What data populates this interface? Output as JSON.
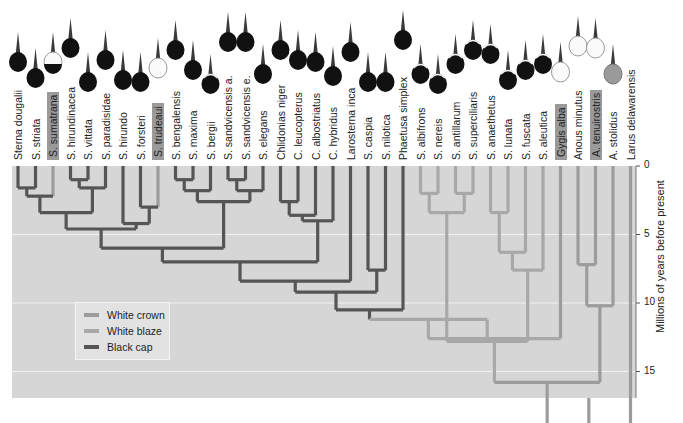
{
  "diagram": {
    "type": "phylogenetic-tree",
    "axis": {
      "title": "Millions of years before present",
      "ticks": [
        "0",
        "5",
        "10",
        "15",
        "20"
      ]
    },
    "legend": [
      {
        "label": "White crown",
        "color": "#9c9c9c"
      },
      {
        "label": "White blaze",
        "color": "#a8a8a8"
      },
      {
        "label": "Black cap",
        "color": "#555555"
      }
    ],
    "colors": {
      "panel_bg": "#d6d6d6",
      "gridline": "#f2f2f2",
      "black_cap": "#555555",
      "white_crown": "#9c9c9c",
      "white_blaze": "#a8a8a8"
    },
    "species": [
      {
        "label": "Sterna dougalii",
        "trait": "black_cap",
        "head": "black",
        "highlight": false
      },
      {
        "label": "S. striata",
        "trait": "black_cap",
        "head": "black",
        "highlight": false
      },
      {
        "label": "S. sumatrana",
        "trait": "white_crown",
        "head": "white_nape",
        "highlight": true
      },
      {
        "label": "S. hirundinacea",
        "trait": "black_cap",
        "head": "black",
        "highlight": false
      },
      {
        "label": "S. vittata",
        "trait": "black_cap",
        "head": "black",
        "highlight": false
      },
      {
        "label": "S. paradisidae",
        "trait": "black_cap",
        "head": "black",
        "highlight": false
      },
      {
        "label": "S. hirundo",
        "trait": "black_cap",
        "head": "black",
        "highlight": false
      },
      {
        "label": "S. forsteri",
        "trait": "black_cap",
        "head": "black",
        "highlight": false
      },
      {
        "label": "S. trudeaui",
        "trait": "white_crown",
        "head": "white",
        "highlight": true
      },
      {
        "label": "S. bengalensis",
        "trait": "black_cap",
        "head": "black",
        "highlight": false
      },
      {
        "label": "S. maxima",
        "trait": "black_cap",
        "head": "black",
        "highlight": false
      },
      {
        "label": "S. bergii",
        "trait": "black_cap",
        "head": "black_blaze",
        "highlight": false
      },
      {
        "label": "S. sandvicensis a.",
        "trait": "black_cap",
        "head": "black",
        "highlight": false
      },
      {
        "label": "S. sandvicensis e.",
        "trait": "black_cap",
        "head": "black",
        "highlight": false
      },
      {
        "label": "S. elegans",
        "trait": "black_cap",
        "head": "black",
        "highlight": false
      },
      {
        "label": "Chlidonias niger",
        "trait": "black_cap",
        "head": "black",
        "highlight": false
      },
      {
        "label": "C. leucopterus",
        "trait": "black_cap",
        "head": "black",
        "highlight": false
      },
      {
        "label": "C. albostriatus",
        "trait": "black_cap",
        "head": "black",
        "highlight": false
      },
      {
        "label": "C. hybridus",
        "trait": "black_cap",
        "head": "black",
        "highlight": false
      },
      {
        "label": "Larosterna inca",
        "trait": "black_cap",
        "head": "black",
        "highlight": false
      },
      {
        "label": "S. caspia",
        "trait": "black_cap",
        "head": "black",
        "highlight": false
      },
      {
        "label": "S. nilotica",
        "trait": "black_cap",
        "head": "black",
        "highlight": false
      },
      {
        "label": "Phaetusa simplex",
        "trait": "black_cap",
        "head": "black",
        "highlight": false
      },
      {
        "label": "S. albifrons",
        "trait": "white_blaze",
        "head": "black_blaze",
        "highlight": false
      },
      {
        "label": "S. nereis",
        "trait": "white_blaze",
        "head": "black_blaze",
        "highlight": false
      },
      {
        "label": "S. antillarum",
        "trait": "white_blaze",
        "head": "black_blaze",
        "highlight": false
      },
      {
        "label": "S. superciliaris",
        "trait": "white_blaze",
        "head": "black_blaze",
        "highlight": false
      },
      {
        "label": "S. anaethetus",
        "trait": "white_blaze",
        "head": "black_blaze",
        "highlight": false
      },
      {
        "label": "S. lunata",
        "trait": "white_blaze",
        "head": "black_blaze",
        "highlight": false
      },
      {
        "label": "S. fuscata",
        "trait": "white_blaze",
        "head": "black_blaze",
        "highlight": false
      },
      {
        "label": "S. aleutica",
        "trait": "white_blaze",
        "head": "black_blaze",
        "highlight": false
      },
      {
        "label": "Gygis alba",
        "trait": "white_crown",
        "head": "white",
        "highlight": true
      },
      {
        "label": "Anous minutus",
        "trait": "white_crown",
        "head": "white",
        "highlight": false
      },
      {
        "label": "A. tenuirostris",
        "trait": "white_crown",
        "head": "white",
        "highlight": true
      },
      {
        "label": "A. stolidus",
        "trait": "white_crown",
        "head": "grey",
        "highlight": false
      },
      {
        "label": "Larus delawarensis",
        "trait": "none",
        "head": "none",
        "highlight": false
      }
    ]
  }
}
